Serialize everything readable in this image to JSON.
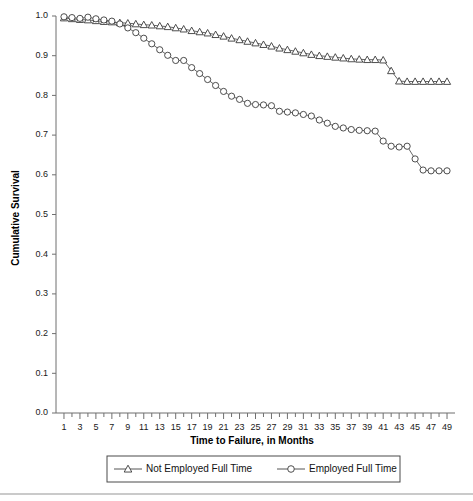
{
  "chart_data": {
    "type": "line",
    "title": "",
    "xlabel": "Time to Failure, in Months",
    "ylabel": "Cumulative Survival",
    "xlim": [
      0,
      50
    ],
    "ylim": [
      0.0,
      1.0
    ],
    "grid": false,
    "legend_position": "bottom",
    "x_ticks_major": [
      1,
      3,
      5,
      7,
      9,
      11,
      13,
      15,
      17,
      19,
      21,
      23,
      25,
      27,
      29,
      31,
      33,
      35,
      37,
      39,
      41,
      43,
      45,
      47,
      49
    ],
    "x_ticks_all": [
      1,
      2,
      3,
      4,
      5,
      6,
      7,
      8,
      9,
      10,
      11,
      12,
      13,
      14,
      15,
      16,
      17,
      18,
      19,
      20,
      21,
      22,
      23,
      24,
      25,
      26,
      27,
      28,
      29,
      30,
      31,
      32,
      33,
      34,
      35,
      36,
      37,
      38,
      39,
      40,
      41,
      42,
      43,
      44,
      45,
      46,
      47,
      48,
      49
    ],
    "y_ticks": [
      0.0,
      0.1,
      0.2,
      0.3,
      0.4,
      0.5,
      0.6,
      0.7,
      0.8,
      0.9,
      1.0
    ],
    "y_tick_labels": [
      "0.0",
      "0.1",
      "0.2",
      "0.3",
      "0.4",
      "0.5",
      "0.6",
      "0.7",
      "0.8",
      "0.9",
      "1.0"
    ],
    "x": [
      1,
      2,
      3,
      4,
      5,
      6,
      7,
      8,
      9,
      10,
      11,
      12,
      13,
      14,
      15,
      16,
      17,
      18,
      19,
      20,
      21,
      22,
      23,
      24,
      25,
      26,
      27,
      28,
      29,
      30,
      31,
      32,
      33,
      34,
      35,
      36,
      37,
      38,
      39,
      40,
      41,
      42,
      43,
      44,
      45,
      46,
      47,
      48,
      49
    ],
    "series": [
      {
        "name": "Not Employed Full Time",
        "marker": "triangle",
        "values": [
          0.995,
          0.993,
          0.991,
          0.99,
          0.988,
          0.986,
          0.985,
          0.983,
          0.982,
          0.98,
          0.978,
          0.977,
          0.975,
          0.973,
          0.97,
          0.967,
          0.963,
          0.96,
          0.957,
          0.953,
          0.949,
          0.944,
          0.94,
          0.936,
          0.932,
          0.928,
          0.924,
          0.919,
          0.915,
          0.911,
          0.907,
          0.903,
          0.9,
          0.898,
          0.896,
          0.894,
          0.892,
          0.891,
          0.89,
          0.89,
          0.889,
          0.862,
          0.836,
          0.835,
          0.835,
          0.835,
          0.835,
          0.835,
          0.835
        ]
      },
      {
        "name": "Employed Full Time",
        "marker": "circle",
        "values": [
          0.998,
          0.996,
          0.994,
          0.997,
          0.993,
          0.99,
          0.987,
          0.98,
          0.97,
          0.958,
          0.944,
          0.93,
          0.915,
          0.901,
          0.888,
          0.888,
          0.87,
          0.855,
          0.84,
          0.825,
          0.81,
          0.798,
          0.79,
          0.78,
          0.777,
          0.776,
          0.774,
          0.76,
          0.758,
          0.756,
          0.752,
          0.748,
          0.738,
          0.73,
          0.722,
          0.718,
          0.714,
          0.712,
          0.711,
          0.71,
          0.685,
          0.672,
          0.67,
          0.672,
          0.64,
          0.612,
          0.61,
          0.61,
          0.61
        ]
      }
    ]
  },
  "legend": {
    "items": [
      {
        "label": "Not Employed Full Time",
        "marker": "triangle"
      },
      {
        "label": "Employed Full Time",
        "marker": "circle"
      }
    ]
  },
  "axes": {
    "x_title": "Time to Failure, in Months",
    "y_title": "Cumulative Survival"
  }
}
